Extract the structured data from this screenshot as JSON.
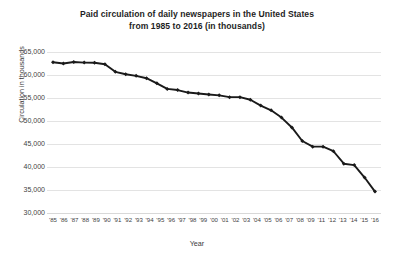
{
  "chart_data": {
    "type": "line",
    "title": "Paid circulation of daily newspapers in the United States from 1985 to 2016 (in thousands)",
    "title_lines": [
      "Paid circulation of daily newspapers in the United States",
      "from 1985 to 2016 (in thousands)"
    ],
    "xlabel": "Year",
    "ylabel": "Circulation in thousands",
    "ylim": [
      30000,
      65000
    ],
    "ytick_step": 5000,
    "ytick_labels": [
      "65,000",
      "60,000",
      "55,000",
      "50,000",
      "45,000",
      "40,000",
      "35,000",
      "30,000"
    ],
    "ytick_values": [
      65000,
      60000,
      55000,
      50000,
      45000,
      40000,
      35000,
      30000
    ],
    "xtick_labels": [
      "'85",
      "'86",
      "'87",
      "'88",
      "'89",
      "'90",
      "'91",
      "'92",
      "'93",
      "'94",
      "'95",
      "'96",
      "'97",
      "'98",
      "'99",
      "'00",
      "'01",
      "'02",
      "'03",
      "'04",
      "'05",
      "'06",
      "'07",
      "'08",
      "'09",
      "'11",
      "'12",
      "'13",
      "'14",
      "'15",
      "'16"
    ],
    "grid": "horizontal",
    "legend": "none",
    "marker": "diamond",
    "line_color": "#1a1a1a",
    "grid_color": "#e3e3e3",
    "background_color": "#ffffff",
    "categories": [
      "1985",
      "1986",
      "1987",
      "1988",
      "1989",
      "1990",
      "1991",
      "1992",
      "1993",
      "1994",
      "1995",
      "1996",
      "1997",
      "1998",
      "1999",
      "2000",
      "2001",
      "2002",
      "2003",
      "2004",
      "2005",
      "2006",
      "2007",
      "2008",
      "2009",
      "2010",
      "2011",
      "2012",
      "2013",
      "2014",
      "2015",
      "2016"
    ],
    "values": [
      62766,
      62502,
      62826,
      62695,
      62649,
      62328,
      60687,
      60164,
      59812,
      59305,
      58193,
      56983,
      56728,
      56182,
      55979,
      55773,
      55578,
      55186,
      55185,
      54626,
      53345,
      52329,
      50742,
      48597,
      45653,
      44421,
      44421,
      43427,
      40712,
      40420,
      37711,
      34657
    ],
    "annotations": []
  }
}
